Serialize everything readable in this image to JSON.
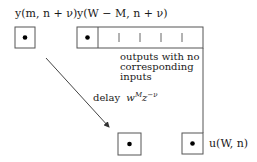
{
  "diagram": {
    "labels": {
      "left_box_label": "y(m, n + ν)",
      "array_label": "y(W − M, n + ν)",
      "annotation_lines": [
        "outputs with no",
        "corresponding",
        "inputs"
      ],
      "delay_prefix": "delay",
      "delay_base_w": "w",
      "delay_sup_M": "M",
      "delay_base_z": "z",
      "delay_sup_nu": "−ν",
      "output_label": "u(W, n)"
    },
    "colors": {
      "stroke": "#555555",
      "dot": "#000000",
      "text": "#1a1a1a"
    }
  }
}
